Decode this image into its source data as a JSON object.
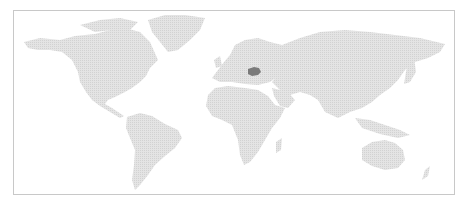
{
  "map": {
    "type": "world-choropleth",
    "land_color": "#dcdcdc",
    "border_color": "#c8c8c8",
    "background": "#ffffff",
    "highlighted_regions": [
      {
        "name": "Romania",
        "color": "#7a7a7a"
      }
    ]
  }
}
